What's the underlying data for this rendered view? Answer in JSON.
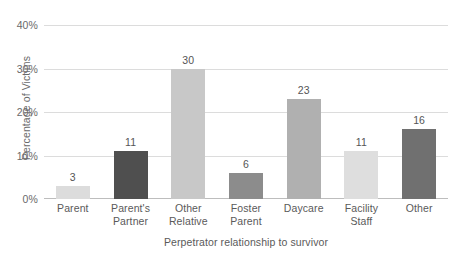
{
  "chart_data": {
    "type": "bar",
    "title": "",
    "xlabel": "Perpetrator relationship to survivor",
    "ylabel": "Percentage of Victims",
    "categories": [
      "Parent",
      "Parent's\nPartner",
      "Other\nRelative",
      "Foster\nParent",
      "Daycare",
      "Facility\nStaff",
      "Other"
    ],
    "values": [
      3,
      11,
      30,
      6,
      23,
      11,
      16
    ],
    "value_labels": [
      "3",
      "11",
      "30",
      "6",
      "23",
      "11",
      "16"
    ],
    "bar_colors": [
      "#dcdcdc",
      "#4f4f4f",
      "#c8c8c8",
      "#8c8c8c",
      "#b0b0b0",
      "#dedede",
      "#707070"
    ],
    "ylim": [
      0,
      40
    ],
    "yticks": [
      0,
      10,
      20,
      30,
      40
    ],
    "ytick_labels": [
      "0%",
      "10%",
      "20%",
      "30%",
      "40%"
    ],
    "grid": true,
    "grid_color": "#dcdcdc",
    "axis_color": "#bdbdbd",
    "legend": "none",
    "background": "#ffffff"
  }
}
